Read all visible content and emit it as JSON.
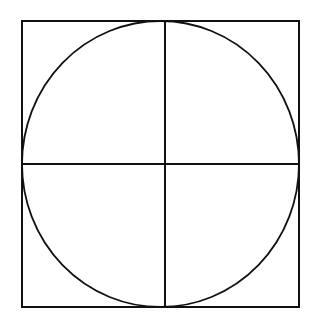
{
  "diagram": {
    "colors": {
      "stroke": "#111111",
      "background": "#ffffff"
    },
    "square": {
      "x": 22,
      "y": 21,
      "width": 277,
      "height": 286
    },
    "circle": {
      "cx": 160.5,
      "cy": 164,
      "rx": 138.5,
      "ry": 143
    },
    "vertical_line": {
      "x": 165,
      "y1": 21,
      "y2": 307
    },
    "horizontal_line": {
      "y": 164,
      "x1": 22,
      "x2": 299
    }
  }
}
